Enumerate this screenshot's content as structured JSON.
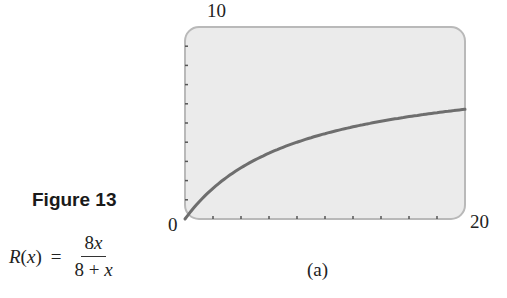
{
  "figure": {
    "title": "Figure 13",
    "formula": {
      "lhs_name": "R",
      "lhs_var": "x",
      "equals": "=",
      "numerator": "8x",
      "denominator": "8 + x",
      "text": "R(x) = 8x / (8 + x)"
    },
    "caption": "(a)"
  },
  "axes": {
    "y_max_label": "10",
    "origin_label": "0",
    "x_max_label": "20"
  },
  "colors": {
    "plot_background": "#ebebeb",
    "plot_border": "#b9b9b9",
    "curve": "#6e6e6e",
    "ticks": "#555555"
  },
  "chart_data": {
    "type": "line",
    "title": "Figure 13",
    "subtitle": "(a)",
    "function": "R(x) = 8x/(8+x)",
    "xlabel": "",
    "ylabel": "",
    "xlim": [
      0,
      20
    ],
    "ylim": [
      0,
      10
    ],
    "x_tick_labels": [
      "0",
      "20"
    ],
    "y_tick_labels": [
      "0",
      "10"
    ],
    "x_minor_ticks": [
      2,
      4,
      6,
      8,
      10,
      12,
      14,
      16,
      18
    ],
    "y_minor_ticks": [
      1,
      2,
      3,
      4,
      5,
      6,
      7,
      8,
      9
    ],
    "grid": false,
    "legend": null,
    "series": [
      {
        "name": "R(x)",
        "x": [
          0,
          1,
          2,
          3,
          4,
          5,
          6,
          7,
          8,
          9,
          10,
          11,
          12,
          13,
          14,
          15,
          16,
          17,
          18,
          19,
          20
        ],
        "y": [
          0,
          0.89,
          1.6,
          2.18,
          2.67,
          3.08,
          3.43,
          3.73,
          4.0,
          4.24,
          4.44,
          4.63,
          4.8,
          4.95,
          5.09,
          5.22,
          5.33,
          5.44,
          5.54,
          5.63,
          5.71
        ]
      }
    ]
  }
}
